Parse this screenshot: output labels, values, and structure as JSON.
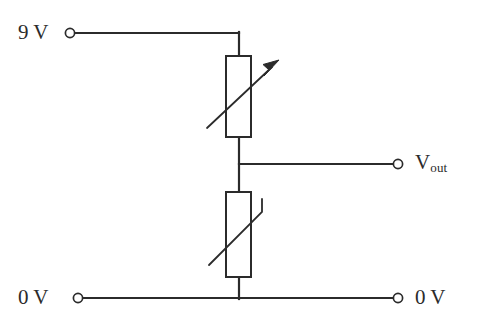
{
  "diagram": {
    "type": "circuit-schematic",
    "stroke_color": "#2b2b2b",
    "fill_color": "#ffffff",
    "background": "#ffffff",
    "terminals": [
      {
        "id": "supply",
        "label": "9 V",
        "label_position": "left",
        "cx": 70,
        "cy": 33,
        "r": 4.5
      },
      {
        "id": "vout",
        "label": "Vout",
        "label_main": "V",
        "label_sub": "out",
        "label_position": "right",
        "cx": 398,
        "cy": 164,
        "r": 4.5
      },
      {
        "id": "ground-left",
        "label": "0 V",
        "label_position": "left",
        "cx": 78,
        "cy": 298,
        "r": 4.5
      },
      {
        "id": "ground-right",
        "label": "0 V",
        "label_position": "right",
        "cx": 398,
        "cy": 298,
        "r": 4.5
      }
    ],
    "components": [
      {
        "id": "variable-resistor",
        "name": "variable-resistor",
        "symbol": "rectangle-with-diagonal-arrow",
        "x": 226,
        "y": 56,
        "width": 25,
        "height": 81,
        "annotation": "arrow pointing up-right"
      },
      {
        "id": "thermistor",
        "name": "thermistor",
        "symbol": "rectangle-with-hooked-diagonal-line",
        "x": 226,
        "y": 192,
        "width": 25,
        "height": 85,
        "annotation": "diagonal line with vertical hook at top-right"
      }
    ],
    "labels": {
      "supply_voltage": "9 V",
      "output": "V",
      "output_subscript": "out",
      "ground_left": "0 V",
      "ground_right": "0 V"
    }
  }
}
